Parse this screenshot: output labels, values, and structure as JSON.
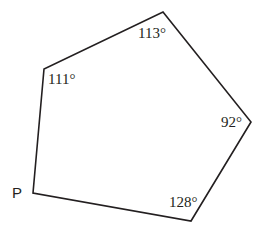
{
  "figure": {
    "name": "pentagon-angle-diagram",
    "background_color": "#ffffff",
    "stroke_color": "#231f20",
    "stroke_width": 1.6,
    "width": 273,
    "height": 233
  },
  "shape": {
    "type": "polygon",
    "sides": 5,
    "fill": "none",
    "points": "33,193 44,69 163,12 251,122 191,221",
    "vertices": [
      {
        "id": "P",
        "x": 33,
        "y": 193,
        "label": "P",
        "angle": null
      },
      {
        "id": "left",
        "x": 44,
        "y": 69,
        "label": "111°",
        "angle": 111
      },
      {
        "id": "top",
        "x": 163,
        "y": 12,
        "label": "113°",
        "angle": 113
      },
      {
        "id": "right",
        "x": 251,
        "y": 122,
        "label": "92°",
        "angle": 92
      },
      {
        "id": "bottom",
        "x": 191,
        "y": 221,
        "label": "128°",
        "angle": 128
      }
    ]
  },
  "labels": {
    "angle_top": "113°",
    "angle_left": "111°",
    "angle_right": "92°",
    "angle_bottom": "128°",
    "vertex_p": "P"
  },
  "chart_data": {
    "type": "diagram",
    "title": "",
    "shape": "pentagon",
    "categories": [
      "P",
      "111° vertex",
      "113° vertex",
      "92° vertex",
      "128° vertex"
    ],
    "values": [
      null,
      111,
      113,
      92,
      128
    ],
    "unit": "degrees",
    "note": "Interior angles of an irregular pentagon; angle at vertex P is unlabeled."
  }
}
